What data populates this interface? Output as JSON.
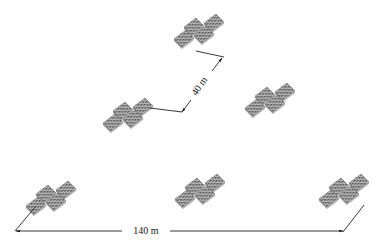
{
  "diagram": {
    "colors": {
      "panel_fill": "#8a8a8a",
      "panel_dark": "#555555",
      "panel_light": "#c8c8c8",
      "line": "#222222",
      "background": "#ffffff"
    },
    "clusters": [
      {
        "id": "top-center",
        "cx": 196,
        "cy": 33
      },
      {
        "id": "middle-left",
        "cx": 125,
        "cy": 117
      },
      {
        "id": "middle-right",
        "cx": 267,
        "cy": 102
      },
      {
        "id": "bottom-left",
        "cx": 48,
        "cy": 200
      },
      {
        "id": "bottom-center",
        "cx": 197,
        "cy": 193
      },
      {
        "id": "bottom-right",
        "cx": 341,
        "cy": 193
      }
    ],
    "dimensions": [
      {
        "id": "spacing-small",
        "label": "40 m",
        "orientation": "diagonal"
      },
      {
        "id": "spacing-large",
        "label": "140 m",
        "orientation": "horizontal"
      }
    ]
  }
}
